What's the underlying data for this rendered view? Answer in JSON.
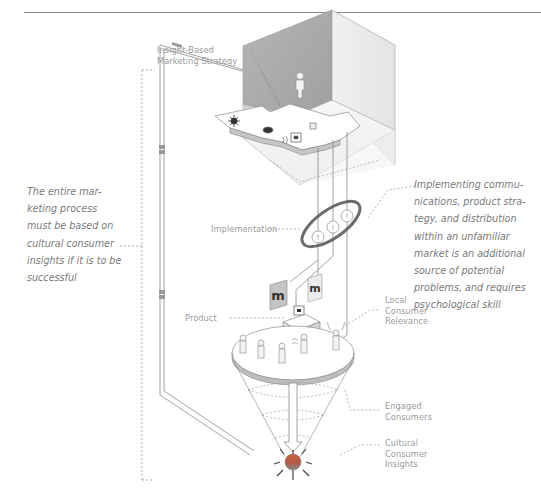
{
  "diagram": {
    "labels": {
      "strategy": [
        "Insight-Based",
        "Marketing Strategy"
      ],
      "implementation": "Implementation",
      "product": "Product",
      "local_relevance": [
        "Local",
        "Consumer",
        "Relevance"
      ],
      "engaged": [
        "Engaged",
        "Consumers"
      ],
      "insights": [
        "Cultural",
        "Consumer",
        "Insights"
      ]
    },
    "notes": {
      "left": [
        "The entire mar-",
        "keting process",
        "must be based on",
        "cultural consumer",
        "insights if it is to be",
        "successful"
      ],
      "right": [
        "Implementing commu-",
        "nications, product stra-",
        "tegy, and distribution",
        "within an unfamiliar",
        "market is an additional",
        "source of potential",
        "problems, and requires",
        "psychological skill"
      ]
    },
    "icons": {
      "warning_symbol": "!",
      "brand_mark": "m"
    },
    "colors": {
      "wall_dark": "#a9a9a9",
      "wall_light": "#eeeeee",
      "outline": "#8c8c8c",
      "ellipse": "#6b6b6b",
      "text": "#9a9a9a",
      "insight_orb_top": "#c9543a",
      "insight_orb_bottom": "#8a8a8a"
    }
  }
}
